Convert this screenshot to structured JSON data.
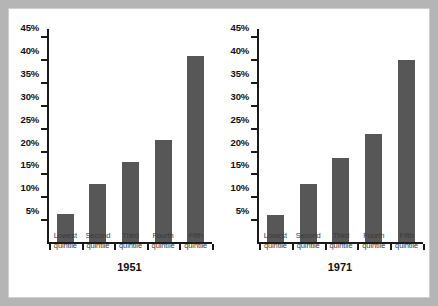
{
  "chart_data": [
    {
      "type": "bar",
      "title": "1951",
      "categories": [
        "Lowest quintile",
        "Second quintile",
        "Third quintile",
        "Fourth quintile",
        "Fifth quintile"
      ],
      "category_lines": [
        [
          "Lowest",
          "quintile"
        ],
        [
          "Second",
          "quintile"
        ],
        [
          "Third",
          "quintile"
        ],
        [
          "Fourth",
          "quintile"
        ],
        [
          "Fifth",
          "quintile"
        ]
      ],
      "values": [
        6.2,
        12.6,
        17.5,
        22.4,
        40.7
      ],
      "value_labels": [
        "6.2%",
        "12.6%",
        "17.5%",
        "22.4%",
        "40.7%"
      ],
      "xlabel": "",
      "ylabel": "",
      "ylim": [
        0,
        47
      ],
      "yticks": [
        5,
        10,
        15,
        20,
        25,
        30,
        35,
        40,
        45
      ],
      "ytick_labels": [
        "5%",
        "10%",
        "15%",
        "20%",
        "25%",
        "30%",
        "35%",
        "40%",
        "45%"
      ],
      "grid": false,
      "legend": false,
      "bar_color": "#575757"
    },
    {
      "type": "bar",
      "title": "1971",
      "categories": [
        "Lowest quintile",
        "Second quintile",
        "Third quintile",
        "Fourth quintile",
        "Fifth quintile"
      ],
      "category_lines": [
        [
          "Lowest",
          "quintile"
        ],
        [
          "Second",
          "quintile"
        ],
        [
          "Third",
          "quintile"
        ],
        [
          "Fourth",
          "quintile"
        ],
        [
          "Fifth",
          "quintile"
        ]
      ],
      "values": [
        6.0,
        12.6,
        18.3,
        23.7,
        39.8
      ],
      "value_labels": [
        "6.0%",
        "12.6%",
        "18.3%",
        "23.7%",
        "39.8%"
      ],
      "xlabel": "",
      "ylabel": "",
      "ylim": [
        0,
        47
      ],
      "yticks": [
        5,
        10,
        15,
        20,
        25,
        30,
        35,
        40,
        45
      ],
      "ytick_labels": [
        "5%",
        "10%",
        "15%",
        "20%",
        "25%",
        "30%",
        "35%",
        "40%",
        "45%"
      ],
      "grid": false,
      "legend": false,
      "bar_color": "#575757"
    }
  ],
  "colors": {
    "frame": "#b5b5b5",
    "panel_background": "#ffffff",
    "axis": "#1a1a1a",
    "bar": "#575757",
    "tick_label": "#111111",
    "category_label": "#3a3a3a"
  }
}
